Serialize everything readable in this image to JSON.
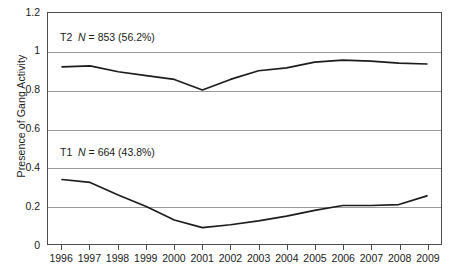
{
  "chart_data": {
    "type": "line",
    "title": "",
    "xlabel": "",
    "ylabel": "Presence of Gang Activity",
    "x": [
      1996,
      1997,
      1998,
      1999,
      2000,
      2001,
      2002,
      2003,
      2004,
      2005,
      2006,
      2007,
      2008,
      2009
    ],
    "categories": [
      "1996",
      "1997",
      "1998",
      "1999",
      "2000",
      "2001",
      "2002",
      "2003",
      "2004",
      "2005",
      "2006",
      "2007",
      "2008",
      "2009"
    ],
    "ylim": [
      0,
      1.2
    ],
    "yticks": [
      0,
      0.2,
      0.4,
      0.6,
      0.8,
      1,
      1.2
    ],
    "ytick_labels": [
      "0",
      "0.2",
      "0.4",
      "0.6",
      "0.8",
      "1",
      "1.2"
    ],
    "grid": "horizontal",
    "legend": "none",
    "series": [
      {
        "name": "T2",
        "label_prefix": "T2",
        "n_label": "N",
        "n_equals": "= 853 (56.2%)",
        "full_label": "T2  N = 853 (56.2%)",
        "values": [
          0.92,
          0.925,
          0.895,
          0.875,
          0.855,
          0.8,
          0.855,
          0.9,
          0.915,
          0.945,
          0.955,
          0.95,
          0.94,
          0.935
        ],
        "color": "#1c1c1c"
      },
      {
        "name": "T1",
        "label_prefix": "T1",
        "n_label": "N",
        "n_equals": "= 664 (43.8%)",
        "full_label": "T1  N = 664 (43.8%)",
        "values": [
          0.335,
          0.32,
          0.255,
          0.195,
          0.125,
          0.085,
          0.1,
          0.12,
          0.145,
          0.175,
          0.2,
          0.2,
          0.205,
          0.25
        ],
        "color": "#1c1c1c"
      }
    ],
    "annotations": [
      {
        "text": "T2  N = 853 (56.2%)",
        "series": "T2",
        "x_px": 12,
        "y_px": 18
      },
      {
        "text": "T1  N = 664 (43.8%)",
        "series": "T1",
        "x_px": 12,
        "y_px": 133
      }
    ],
    "axis_color": "#4d4d4d",
    "gridline_color": "#9a9a9a"
  }
}
